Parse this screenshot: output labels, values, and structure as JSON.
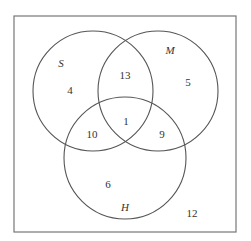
{
  "diagram": {
    "type": "venn-3",
    "universe_box": {
      "x": 14,
      "y": 16,
      "width": 222,
      "height": 216,
      "stroke": "#777777"
    },
    "sets": [
      {
        "name": "S",
        "cx": 93,
        "cy": 91,
        "r": 60,
        "label_x": 61,
        "label_y": 63
      },
      {
        "name": "M",
        "cx": 158,
        "cy": 91,
        "r": 60,
        "label_x": 170,
        "label_y": 50
      },
      {
        "name": "H",
        "cx": 125,
        "cy": 158,
        "r": 61,
        "label_x": 125,
        "label_y": 207
      }
    ],
    "circle_stroke": "#555555",
    "regions": [
      {
        "id": "S_only",
        "value": "4",
        "x": 70,
        "y": 90
      },
      {
        "id": "S_and_M_only",
        "value": "13",
        "x": 125,
        "y": 75
      },
      {
        "id": "M_only",
        "value": "5",
        "x": 188,
        "y": 82
      },
      {
        "id": "S_and_H_only",
        "value": "10",
        "x": 92,
        "y": 134
      },
      {
        "id": "S_M_H",
        "value": "1",
        "x": 126,
        "y": 121
      },
      {
        "id": "M_and_H_only",
        "value": "9",
        "x": 162,
        "y": 134
      },
      {
        "id": "H_only",
        "value": "6",
        "x": 108,
        "y": 184
      },
      {
        "id": "outside",
        "value": "12",
        "x": 192,
        "y": 213
      }
    ]
  }
}
